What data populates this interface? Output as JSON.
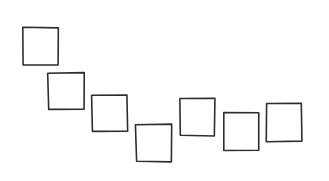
{
  "drawing": {
    "description": "hand-drawn sketch of seven outlined squares arranged in a wave",
    "stroke_color": "#2e2e2e",
    "background_color": "#ffffff",
    "squares": [
      {
        "id": 1,
        "x": 23,
        "y": 28,
        "w": 35,
        "h": 37
      },
      {
        "id": 2,
        "x": 48,
        "y": 73,
        "w": 36,
        "h": 37
      },
      {
        "id": 3,
        "x": 92,
        "y": 95,
        "w": 35,
        "h": 37
      },
      {
        "id": 4,
        "x": 136,
        "y": 124,
        "w": 36,
        "h": 38
      },
      {
        "id": 5,
        "x": 180,
        "y": 98,
        "w": 35,
        "h": 38
      },
      {
        "id": 6,
        "x": 224,
        "y": 112,
        "w": 35,
        "h": 38
      },
      {
        "id": 7,
        "x": 267,
        "y": 103,
        "w": 35,
        "h": 38
      }
    ]
  }
}
